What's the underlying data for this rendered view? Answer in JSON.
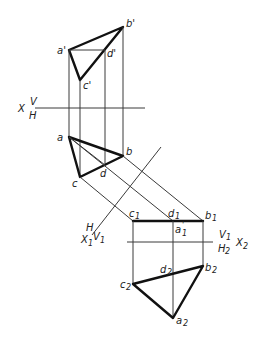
{
  "diagram": {
    "title": "",
    "type": "descriptive-geometry-auxiliary-projection",
    "axes": {
      "x_main": {
        "left": "X",
        "upper": "V",
        "lower": "H"
      },
      "x1": {
        "upper": "H",
        "lower_left": "X",
        "lower_sub": "1",
        "right": "V",
        "right_sub": "1"
      },
      "x2": {
        "upper": "V",
        "upper_sub": "1",
        "lower": "H",
        "lower_sub": "2",
        "right": "X",
        "right_sub": "2"
      }
    },
    "labels": {
      "a_front": "a'",
      "b_front": "b'",
      "c_front": "c'",
      "d_front": "d'",
      "a_top": "a",
      "b_top": "b",
      "c_top": "c",
      "d_top": "d",
      "c1": "c",
      "c1_sub": "1",
      "c1_prime": "'",
      "d1": "d",
      "d1_sub": "1",
      "d1_prime": "'",
      "b1": "b",
      "b1_sub": "1",
      "b1_prime": "'",
      "a1": "a",
      "a1_sub": "1",
      "a1_prime": "'",
      "a2": "a",
      "a2_sub": "2",
      "b2": "b",
      "b2_sub": "2",
      "c2": "c",
      "c2_sub": "2",
      "d2": "d",
      "d2_sub": "2"
    },
    "colors": {
      "line": "#3a3a3a",
      "outline": "#111111",
      "background": "#ffffff"
    }
  }
}
